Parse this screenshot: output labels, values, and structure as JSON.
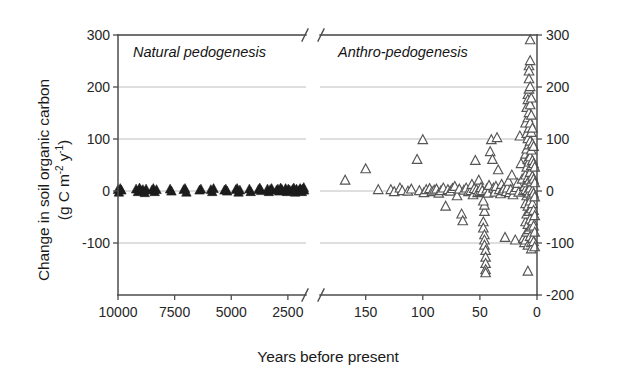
{
  "axes": {
    "ylabel_line1": "Change in soil organic carbon",
    "ylabel_line2_pre": "(g C m",
    "ylabel_line2_sup1": "-2",
    "ylabel_line2_mid": " y",
    "ylabel_line2_sup2": "-1",
    "ylabel_line2_post": ")",
    "xlabel": "Years before present"
  },
  "annotations": {
    "left_panel": "Natural pedogenesis",
    "right_panel": "Anthro-pedogenesis"
  },
  "chart_data": {
    "type": "scatter",
    "title": "",
    "xlabel": "Years before present",
    "ylabel": "Change in soil organic carbon (g C m-2 y-1)",
    "grid": true,
    "legend": false,
    "x_reversed": true,
    "axis_break": true,
    "gridlines_y": [
      300,
      200,
      100,
      0,
      -100
    ],
    "left_axis": {
      "ticks": [
        300,
        200,
        100,
        0,
        -100
      ],
      "tick_labels": [
        "300",
        "200",
        "100",
        "0",
        "-100"
      ],
      "ylim": [
        -200,
        300
      ]
    },
    "right_axis": {
      "ticks": [
        300,
        200,
        100,
        0,
        -100,
        -200
      ],
      "tick_labels": [
        "300",
        "200",
        "100",
        "0",
        "-100",
        "-200"
      ],
      "ylim": [
        -200,
        300
      ]
    },
    "panels": [
      {
        "name": "Natural pedogenesis",
        "xlim": [
          10000,
          1700
        ],
        "xticks": [
          10000,
          7500,
          5000,
          2500
        ],
        "xtick_labels": [
          "10000",
          "7500",
          "5000",
          "2500"
        ],
        "marker": "filled-triangle",
        "marker_color": "#1c1c1c",
        "points": [
          [
            10000,
            2
          ],
          [
            9960,
            -3
          ],
          [
            9900,
            4
          ],
          [
            9850,
            1
          ],
          [
            9200,
            3
          ],
          [
            9120,
            -2
          ],
          [
            9050,
            5
          ],
          [
            8980,
            0
          ],
          [
            8900,
            2
          ],
          [
            8820,
            -4
          ],
          [
            8760,
            3
          ],
          [
            8500,
            1
          ],
          [
            8440,
            4
          ],
          [
            8380,
            -2
          ],
          [
            8300,
            2
          ],
          [
            7700,
            3
          ],
          [
            7640,
            -1
          ],
          [
            7100,
            2
          ],
          [
            7040,
            4
          ],
          [
            6980,
            -3
          ],
          [
            6400,
            1
          ],
          [
            6340,
            3
          ],
          [
            5900,
            2
          ],
          [
            5840,
            -2
          ],
          [
            5780,
            4
          ],
          [
            5300,
            1
          ],
          [
            5240,
            3
          ],
          [
            5180,
            -1
          ],
          [
            4800,
            2
          ],
          [
            4740,
            4
          ],
          [
            4680,
            -3
          ],
          [
            4620,
            1
          ],
          [
            4200,
            3
          ],
          [
            4140,
            -2
          ],
          [
            3800,
            2
          ],
          [
            3740,
            5
          ],
          [
            3680,
            0
          ],
          [
            3400,
            3
          ],
          [
            3340,
            -2
          ],
          [
            3280,
            2
          ],
          [
            3220,
            4
          ],
          [
            3000,
            1
          ],
          [
            2940,
            3
          ],
          [
            2880,
            -1
          ],
          [
            2820,
            5
          ],
          [
            2760,
            2
          ],
          [
            2600,
            4
          ],
          [
            2540,
            -2
          ],
          [
            2480,
            3
          ],
          [
            2420,
            1
          ],
          [
            2300,
            2
          ],
          [
            2240,
            5
          ],
          [
            2180,
            -3
          ],
          [
            2120,
            3
          ],
          [
            2000,
            1
          ],
          [
            1960,
            4
          ],
          [
            1920,
            2
          ],
          [
            1880,
            -2
          ],
          [
            1840,
            3
          ],
          [
            1800,
            6
          ],
          [
            1780,
            1
          ]
        ]
      },
      {
        "name": "Anthro-pedogenesis",
        "xlim": [
          190,
          0
        ],
        "xticks": [
          150,
          100,
          50,
          0
        ],
        "xtick_labels": [
          "150",
          "100",
          "50",
          "0"
        ],
        "marker": "open-triangle",
        "marker_color": "#555555",
        "points": [
          [
            168,
            20
          ],
          [
            150,
            42
          ],
          [
            139,
            2
          ],
          [
            128,
            2
          ],
          [
            125,
            -2
          ],
          [
            120,
            5
          ],
          [
            118,
            0
          ],
          [
            113,
            -1
          ],
          [
            110,
            3
          ],
          [
            105,
            60
          ],
          [
            103,
            0
          ],
          [
            100,
            98
          ],
          [
            99,
            -4
          ],
          [
            97,
            2
          ],
          [
            94,
            4
          ],
          [
            92,
            -2
          ],
          [
            90,
            1
          ],
          [
            88,
            3
          ],
          [
            86,
            -5
          ],
          [
            84,
            0
          ],
          [
            82,
            5
          ],
          [
            80,
            -30
          ],
          [
            78,
            2
          ],
          [
            76,
            -1
          ],
          [
            74,
            4
          ],
          [
            72,
            8
          ],
          [
            70,
            -10
          ],
          [
            68,
            3
          ],
          [
            66,
            -45
          ],
          [
            65,
            -58
          ],
          [
            64,
            1
          ],
          [
            62,
            5
          ],
          [
            60,
            -2
          ],
          [
            58,
            0
          ],
          [
            57,
            12
          ],
          [
            56,
            -8
          ],
          [
            55,
            4
          ],
          [
            54,
            58
          ],
          [
            53,
            2
          ],
          [
            52,
            -4
          ],
          [
            51,
            20
          ],
          [
            50,
            -2
          ],
          [
            49,
            6
          ],
          [
            48,
            0
          ],
          [
            47,
            -60
          ],
          [
            47,
            -72
          ],
          [
            46,
            -85
          ],
          [
            46,
            -95
          ],
          [
            46,
            -105
          ],
          [
            45,
            -115
          ],
          [
            45,
            -128
          ],
          [
            45,
            -140
          ],
          [
            45,
            -152
          ],
          [
            45,
            -158
          ],
          [
            46,
            -40
          ],
          [
            46,
            -28
          ],
          [
            47,
            -20
          ],
          [
            44,
            3
          ],
          [
            43,
            -5
          ],
          [
            42,
            10
          ],
          [
            41,
            75
          ],
          [
            40,
            98
          ],
          [
            39,
            60
          ],
          [
            38,
            5
          ],
          [
            37,
            -3
          ],
          [
            36,
            8
          ],
          [
            35,
            102
          ],
          [
            34,
            40
          ],
          [
            33,
            2
          ],
          [
            32,
            -6
          ],
          [
            31,
            12
          ],
          [
            30,
            0
          ],
          [
            29,
            3
          ],
          [
            28,
            -90
          ],
          [
            27,
            -2
          ],
          [
            26,
            5
          ],
          [
            25,
            18
          ],
          [
            24,
            -4
          ],
          [
            23,
            2
          ],
          [
            22,
            30
          ],
          [
            21,
            -8
          ],
          [
            20,
            1
          ],
          [
            19,
            -95
          ],
          [
            18,
            6
          ],
          [
            17,
            14
          ],
          [
            16,
            -3
          ],
          [
            15,
            105
          ],
          [
            14,
            52
          ],
          [
            13,
            22
          ],
          [
            12,
            0
          ],
          [
            12,
            -92
          ],
          [
            11,
            8
          ],
          [
            11,
            -100
          ],
          [
            10,
            130
          ],
          [
            10,
            70
          ],
          [
            10,
            30
          ],
          [
            10,
            2
          ],
          [
            10,
            -25
          ],
          [
            10,
            -60
          ],
          [
            10,
            -95
          ],
          [
            9,
            160
          ],
          [
            9,
            110
          ],
          [
            9,
            80
          ],
          [
            9,
            45
          ],
          [
            9,
            15
          ],
          [
            9,
            -10
          ],
          [
            9,
            -45
          ],
          [
            9,
            -80
          ],
          [
            8,
            185
          ],
          [
            8,
            175
          ],
          [
            8,
            140
          ],
          [
            8,
            100
          ],
          [
            8,
            60
          ],
          [
            8,
            25
          ],
          [
            8,
            0
          ],
          [
            8,
            -30
          ],
          [
            8,
            -65
          ],
          [
            8,
            -105
          ],
          [
            7,
            240
          ],
          [
            7,
            230
          ],
          [
            7,
            215
          ],
          [
            7,
            195
          ],
          [
            7,
            150
          ],
          [
            7,
            120
          ],
          [
            7,
            88
          ],
          [
            7,
            55
          ],
          [
            7,
            20
          ],
          [
            7,
            -5
          ],
          [
            7,
            -40
          ],
          [
            7,
            -75
          ],
          [
            6,
            290
          ],
          [
            6,
            250
          ],
          [
            6,
            200
          ],
          [
            6,
            165
          ],
          [
            6,
            130
          ],
          [
            6,
            95
          ],
          [
            6,
            65
          ],
          [
            6,
            35
          ],
          [
            6,
            5
          ],
          [
            6,
            -20
          ],
          [
            6,
            -55
          ],
          [
            6,
            -88
          ],
          [
            5,
            178
          ],
          [
            5,
            145
          ],
          [
            5,
            112
          ],
          [
            5,
            78
          ],
          [
            5,
            48
          ],
          [
            5,
            18
          ],
          [
            5,
            -8
          ],
          [
            5,
            -35
          ],
          [
            5,
            -70
          ],
          [
            5,
            -100
          ],
          [
            5,
            -112
          ],
          [
            4,
            120
          ],
          [
            4,
            90
          ],
          [
            4,
            58
          ],
          [
            4,
            28
          ],
          [
            4,
            0
          ],
          [
            4,
            -25
          ],
          [
            4,
            -58
          ],
          [
            4,
            -92
          ],
          [
            3,
            85
          ],
          [
            3,
            52
          ],
          [
            3,
            22
          ],
          [
            3,
            -5
          ],
          [
            3,
            -38
          ],
          [
            3,
            -68
          ],
          [
            3,
            -98
          ],
          [
            2,
            45
          ],
          [
            2,
            15
          ],
          [
            2,
            -12
          ],
          [
            2,
            -48
          ],
          [
            2,
            -80
          ],
          [
            2,
            -108
          ],
          [
            8,
            -155
          ]
        ]
      }
    ]
  }
}
